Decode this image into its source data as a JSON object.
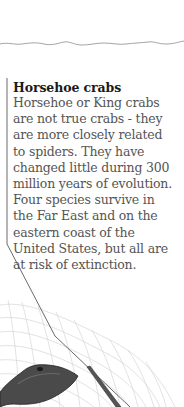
{
  "caption": {
    "title": "Horsehoe crabs",
    "lines": [
      "Horsehoe or King crabs",
      "are not true crabs - they",
      "are more closely related",
      "to spiders. They have",
      "changed little during 300",
      "million years of evolution.",
      "Four species survive in",
      "the Far East and on the",
      "eastern coast of the",
      "United States, but all are",
      "at risk of extinction."
    ]
  },
  "illustration": {
    "subject": "horseshoe-crab-with-net",
    "line_color": "#333333",
    "net_color": "#bbbbbb"
  }
}
